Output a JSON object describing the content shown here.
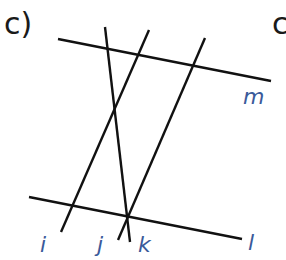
{
  "part_label": "c)",
  "corner_glyph": "c",
  "diagram": {
    "line_color": "#111111",
    "label_color": "#3a5a9a",
    "lines": [
      {
        "name": "m",
        "x1": 58,
        "y1": 39,
        "x2": 271,
        "y2": 81
      },
      {
        "name": "l",
        "x1": 29,
        "y1": 197,
        "x2": 242,
        "y2": 239
      },
      {
        "name": "i",
        "x1": 149,
        "y1": 30,
        "x2": 61,
        "y2": 232
      },
      {
        "name": "j",
        "x1": 105,
        "y1": 27,
        "x2": 130,
        "y2": 242
      },
      {
        "name": "k",
        "x1": 205,
        "y1": 38,
        "x2": 118,
        "y2": 240
      }
    ],
    "labels": [
      {
        "text": "m",
        "x": 243,
        "y": 84
      },
      {
        "text": "i",
        "x": 40,
        "y": 232
      },
      {
        "text": "j",
        "x": 97,
        "y": 232
      },
      {
        "text": "k",
        "x": 138,
        "y": 232
      },
      {
        "text": "l",
        "x": 248,
        "y": 230
      }
    ]
  }
}
